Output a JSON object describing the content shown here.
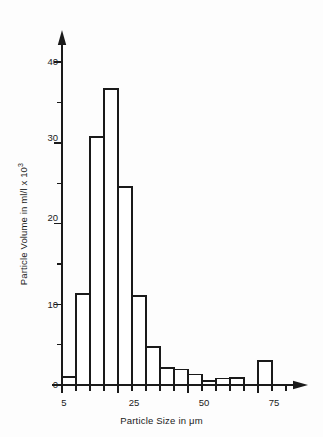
{
  "chart_data": {
    "type": "bar",
    "title": "",
    "subtitle": "",
    "xlabel": "Particle Size in μm",
    "ylabel": "Particle Volume in ml/l x 10",
    "ylabel_exponent": "3",
    "grid": false,
    "legend": null,
    "legend_position": "none",
    "xlim": [
      0,
      93
    ],
    "ylim": [
      0,
      45
    ],
    "y_ticks_major": [
      0,
      10,
      20,
      30,
      40
    ],
    "y_ticks_minor": [
      5,
      15,
      25,
      35,
      45
    ],
    "x_ticks_labeled": [
      5,
      25,
      50,
      75
    ],
    "x_ticks_all": [
      5,
      10,
      15,
      20,
      25,
      30,
      35,
      40,
      45,
      50,
      55,
      60,
      65,
      70,
      75,
      80,
      85
    ],
    "bin_width": 5,
    "bars": [
      {
        "bin_start": 5,
        "bin_end": 10,
        "value": 1.0
      },
      {
        "bin_start": 10,
        "bin_end": 15,
        "value": 11.3
      },
      {
        "bin_start": 15,
        "bin_end": 20,
        "value": 30.7
      },
      {
        "bin_start": 20,
        "bin_end": 25,
        "value": 36.7
      },
      {
        "bin_start": 25,
        "bin_end": 30,
        "value": 24.5
      },
      {
        "bin_start": 30,
        "bin_end": 35,
        "value": 11.0
      },
      {
        "bin_start": 35,
        "bin_end": 40,
        "value": 4.7
      },
      {
        "bin_start": 40,
        "bin_end": 45,
        "value": 2.1
      },
      {
        "bin_start": 45,
        "bin_end": 50,
        "value": 1.9
      },
      {
        "bin_start": 50,
        "bin_end": 55,
        "value": 1.3
      },
      {
        "bin_start": 55,
        "bin_end": 60,
        "value": 0.5
      },
      {
        "bin_start": 60,
        "bin_end": 65,
        "value": 0.8
      },
      {
        "bin_start": 65,
        "bin_end": 70,
        "value": 0.9
      },
      {
        "bin_start": 70,
        "bin_end": 75,
        "value": 0.0
      },
      {
        "bin_start": 75,
        "bin_end": 80,
        "value": 3.0
      }
    ],
    "categories": [
      "5-10",
      "10-15",
      "15-20",
      "20-25",
      "25-30",
      "30-35",
      "35-40",
      "40-45",
      "45-50",
      "50-55",
      "55-60",
      "60-65",
      "65-70",
      "70-75",
      "75-80"
    ],
    "values": [
      1.0,
      11.3,
      30.7,
      36.7,
      24.5,
      11.0,
      4.7,
      2.1,
      1.9,
      1.3,
      0.5,
      0.8,
      0.9,
      0.0,
      3.0
    ],
    "colors": {
      "ink": "#1a1a1a",
      "bar_fill": "#ffffff",
      "bar_stroke": "#1a1a1a",
      "background": "#fdfdfd"
    }
  },
  "axis_labels": {
    "y": [
      "40",
      "30",
      "20",
      "10",
      "0"
    ],
    "x": [
      "5",
      "25",
      "50",
      "75"
    ]
  }
}
